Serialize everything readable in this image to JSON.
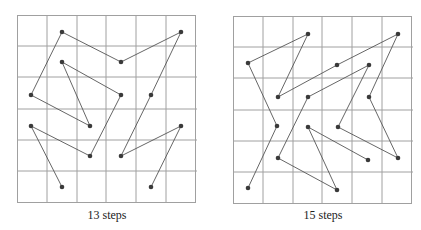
{
  "diagrams": [
    {
      "caption": "13 steps",
      "grid": {
        "rows": 6,
        "cols": 6
      },
      "path": [
        [
          1,
          5
        ],
        [
          0,
          3
        ],
        [
          2,
          1
        ],
        [
          0,
          2
        ],
        [
          1,
          0
        ],
        [
          3,
          1
        ],
        [
          5,
          0
        ],
        [
          3,
          4
        ],
        [
          5,
          3
        ],
        [
          4,
          5
        ]
      ],
      "path_b": [
        [
          2,
          3
        ],
        [
          1,
          1
        ],
        [
          3,
          2
        ],
        [
          2,
          4
        ],
        [
          0,
          3
        ]
      ],
      "colors": {
        "grid": "#999999",
        "line": "#555555",
        "dot": "#3a3a3a"
      }
    },
    {
      "caption": "15 steps",
      "grid": {
        "rows": 6,
        "cols": 6
      },
      "colors": {
        "grid": "#999999",
        "line": "#555555",
        "dot": "#3a3a3a"
      }
    }
  ]
}
